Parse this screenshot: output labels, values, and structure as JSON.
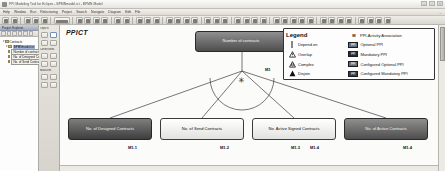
{
  "window": {
    "title": "PPI Modeling Tool for Eclipse - BPMNmodel.ict - BPMN Model",
    "min_label": "–",
    "max_label": "□",
    "close_label": "×"
  },
  "menubar": {
    "items": [
      "File",
      "Edit",
      "Diagram",
      "Navigate",
      "Search",
      "Project",
      "Refactoring",
      "Run",
      "Window",
      "Help"
    ],
    "right_label": "⌄"
  },
  "left_panel": {
    "header": "Project Explorer",
    "tree": [
      {
        "label": "Contracts",
        "level": 0,
        "twist": "▾",
        "style": "plain"
      },
      {
        "label": "BPMNmodel.ict",
        "level": 1,
        "twist": "▾",
        "style": "selected"
      },
      {
        "label": "Number of contracts",
        "level": 2,
        "twist": "",
        "style": "boxed"
      },
      {
        "label": "No. of Designed Contr.",
        "level": 2,
        "twist": "",
        "style": "boxed"
      },
      {
        "label": "No. of Send Contracts",
        "level": 2,
        "twist": "",
        "style": "boxed"
      }
    ]
  },
  "palette": {
    "sections": [
      "Objects",
      "Connections",
      "Measures"
    ]
  },
  "canvas": {
    "title": "PPICT",
    "root_node": {
      "label": "Number of contracts",
      "id": "M1"
    },
    "star_symbol": "✳",
    "nodes": [
      {
        "label": "No. of Designed Contracts",
        "id": "M1.1"
      },
      {
        "label": "No. of Send Contracts",
        "id": "M1.2"
      },
      {
        "label": "No. Active Signed Contracts",
        "id": "M1.3"
      },
      {
        "label": "No. of Active Contracts",
        "id": "M1.4"
      }
    ],
    "extra_labels": [
      "M1.4"
    ]
  },
  "legend": {
    "title": "Legend",
    "m_header": "M",
    "left_items": [
      {
        "symbol": "depend-on",
        "label": "Depend on"
      },
      {
        "symbol": "overlap",
        "label": "Overlap"
      },
      {
        "symbol": "complex",
        "label": "Complex"
      },
      {
        "symbol": "disjoin",
        "label": "Disjoin"
      }
    ],
    "right_items": [
      {
        "badge": "",
        "label": "PPI-Activity Association"
      },
      {
        "badge": "PPI",
        "label": "Optional PPI"
      },
      {
        "badge": "PPI",
        "label": "Mandatory PPI"
      },
      {
        "badge": "PPI",
        "label": "Configured Optional PPI"
      },
      {
        "badge": "PPI",
        "label": "Configured Mandatory PPI"
      }
    ]
  }
}
